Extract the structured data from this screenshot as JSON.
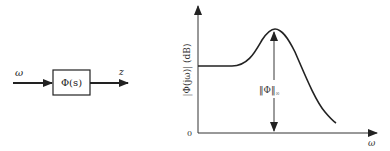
{
  "block_diagram": {
    "input_label": "ω",
    "block_label": "Φ(s)",
    "output_label": "z"
  },
  "plot": {
    "y_axis_label": "|Φ(jω)| (dB)",
    "x_axis_label": "ω",
    "origin_label": "0",
    "annotation_label": "‖Φ‖",
    "annotation_subscript": "∞"
  },
  "colors": {
    "ink": "#222222",
    "background": "#ffffff"
  }
}
